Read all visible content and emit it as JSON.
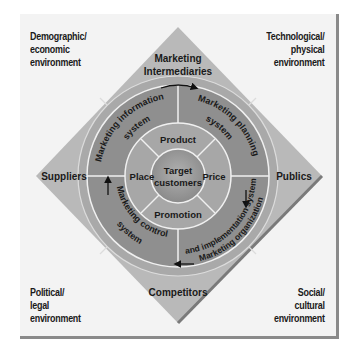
{
  "environments": {
    "top_left": [
      "Demographic/",
      "economic",
      "environment"
    ],
    "top_right": [
      "Technological/",
      "physical",
      "environment"
    ],
    "bottom_left": [
      "Political/",
      "legal",
      "environment"
    ],
    "bottom_right": [
      "Social/",
      "cultural",
      "environment"
    ]
  },
  "actors": {
    "top": [
      "Marketing",
      "Intermediaries"
    ],
    "left": "Suppliers",
    "right": "Publics",
    "bottom": "Competitors"
  },
  "systems": {
    "information": [
      "Marketing information",
      "system"
    ],
    "planning": [
      "Marketing planning",
      "system"
    ],
    "organization": [
      "Marketing organization",
      "and implementation system"
    ],
    "control": [
      "Marketing control",
      "system"
    ]
  },
  "marketing_mix": {
    "product": "Product",
    "price": "Price",
    "promotion": "Promotion",
    "place": "Place"
  },
  "center": [
    "Target",
    "customers"
  ],
  "colors": {
    "background": "#f3f3f3",
    "diamond": "#b9b9b9",
    "diamond_edge": "#a0a0a0",
    "outer_ring": "#8f8f8f",
    "mix_ring": "#a7a7a7",
    "center": "#9a9a9a",
    "divider": "#f0f0f0",
    "frame_border": "#8a8a8a"
  }
}
